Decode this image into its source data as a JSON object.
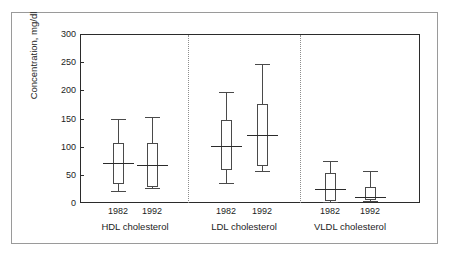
{
  "chart_data": {
    "type": "box",
    "title": "",
    "subtitle": "",
    "xlabel": "",
    "ylabel": "Concentration, mg/dl",
    "ylim": [
      0,
      300
    ],
    "yticks": [
      0,
      50,
      100,
      150,
      200,
      250,
      300
    ],
    "ytick_labels": [
      "0",
      "50",
      "100",
      "150",
      "200",
      "250",
      "300"
    ],
    "grid": false,
    "legend": "none",
    "group_separators": true,
    "groups": [
      {
        "label": "HDL cholesterol",
        "boxes": [
          {
            "category": "1982",
            "whisker_low": 21,
            "q1": 34,
            "median": 71,
            "q3": 107,
            "whisker_high": 150
          },
          {
            "category": "1992",
            "whisker_low": 27,
            "q1": 29,
            "median": 67,
            "q3": 107,
            "whisker_high": 152
          }
        ]
      },
      {
        "label": "LDL cholesterol",
        "boxes": [
          {
            "category": "1982",
            "whisker_low": 35,
            "q1": 58,
            "median": 102,
            "q3": 147,
            "whisker_high": 197
          },
          {
            "category": "1992",
            "whisker_low": 57,
            "q1": 65,
            "median": 120,
            "q3": 175,
            "whisker_high": 247
          }
        ]
      },
      {
        "label": "VLDL cholesterol",
        "boxes": [
          {
            "category": "1982",
            "whisker_low": 2,
            "q1": 4,
            "median": 25,
            "q3": 54,
            "whisker_high": 74
          },
          {
            "category": "1992",
            "whisker_low": 3,
            "q1": 5,
            "median": 10,
            "q3": 28,
            "whisker_high": 57
          }
        ]
      }
    ],
    "colors": {
      "axis": "#2b2b2b",
      "box_stroke": "#4a4a4a",
      "median": "#2b2b2b",
      "separator": "#8d8d8d",
      "frame": "#9a9a9a",
      "background": "#ffffff",
      "text": "#1d1d1d"
    }
  }
}
